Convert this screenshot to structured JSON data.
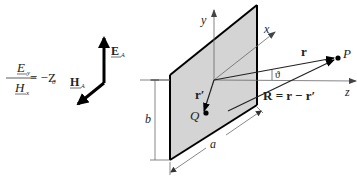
{
  "equation": {
    "numerator": "E",
    "numerator_sub": "y",
    "denominator": "H",
    "denominator_sub": "x",
    "rhs": "= −Z",
    "rhs_sub": "0"
  },
  "field_vectors": {
    "e_label": "E",
    "e_sub": "A",
    "h_label": "H",
    "h_sub": "A"
  },
  "axes": {
    "x": "x",
    "y": "y",
    "z": "z"
  },
  "plate": {
    "fill": "#d4d4d4",
    "edge_color": "#000000",
    "dim_a": "a",
    "dim_b": "b"
  },
  "points": {
    "P": "P",
    "Q": "Q"
  },
  "vectors": {
    "r": "r",
    "r_prime": "r′",
    "R_eq": "R = r − r′",
    "angle": "ϑ"
  }
}
